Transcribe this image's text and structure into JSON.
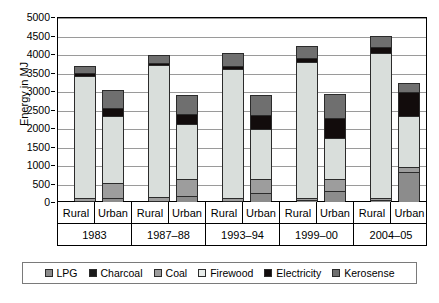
{
  "chart_data": {
    "type": "bar",
    "subtype": "stacked-bar",
    "title": "",
    "xlabel": "",
    "ylabel": "Energy in MJ",
    "ylim": [
      0,
      5000
    ],
    "ytick_step": 500,
    "yticks": [
      5000,
      4500,
      4000,
      3500,
      3000,
      2500,
      2000,
      1500,
      1000,
      500,
      0
    ],
    "grid": true,
    "legend_position": "bottom",
    "categories": [
      "Rural",
      "Urban",
      "Rural",
      "Urban",
      "Rural",
      "Urban",
      "Rural",
      "Urban",
      "Rural",
      "Urban"
    ],
    "groups": [
      {
        "label": "1983",
        "categories": [
          "Rural",
          "Urban"
        ]
      },
      {
        "label": "1987–88",
        "categories": [
          "Rural",
          "Urban"
        ]
      },
      {
        "label": "1993–94",
        "categories": [
          "Rural",
          "Urban"
        ]
      },
      {
        "label": "1999–00",
        "categories": [
          "Rural",
          "Urban"
        ]
      },
      {
        "label": "2004–05",
        "categories": [
          "Rural",
          "Urban"
        ]
      }
    ],
    "series": [
      {
        "name": "LPG",
        "color": "#8c8c8c",
        "values": [
          20,
          100,
          25,
          165,
          30,
          230,
          45,
          300,
          60,
          820
        ]
      },
      {
        "name": "Charcoal",
        "color": "#1a1a1a",
        "values": [
          0,
          0,
          0,
          0,
          0,
          0,
          0,
          0,
          0,
          0
        ]
      },
      {
        "name": "Coal",
        "color": "#9d9d9d",
        "values": [
          95,
          400,
          105,
          460,
          85,
          390,
          70,
          330,
          50,
          120
        ]
      },
      {
        "name": "Firewood",
        "color": "#d9dedb",
        "values": [
          3300,
          1830,
          3570,
          1480,
          3490,
          1360,
          3670,
          1090,
          3930,
          1390
        ]
      },
      {
        "name": "Electricity",
        "color": "#120c0c",
        "values": [
          85,
          200,
          55,
          280,
          75,
          360,
          115,
          560,
          155,
          640
        ]
      },
      {
        "name": "Kerosense",
        "color": "#6f6f6f",
        "values": [
          150,
          470,
          185,
          490,
          320,
          520,
          280,
          610,
          275,
          230
        ]
      }
    ],
    "totals": [
      3650,
      3000,
      3940,
      2875,
      4000,
      2860,
      4180,
      2890,
      4470,
      3200
    ]
  },
  "legend": {
    "items": [
      {
        "label": "LPG",
        "color": "#8c8c8c"
      },
      {
        "label": "Charcoal",
        "color": "#1a1a1a"
      },
      {
        "label": "Coal",
        "color": "#9d9d9d"
      },
      {
        "label": "Firewood",
        "color": "#e8ecea"
      },
      {
        "label": "Electricity",
        "color": "#120c0c"
      },
      {
        "label": "Kerosense",
        "color": "#6f6f6f"
      }
    ]
  }
}
